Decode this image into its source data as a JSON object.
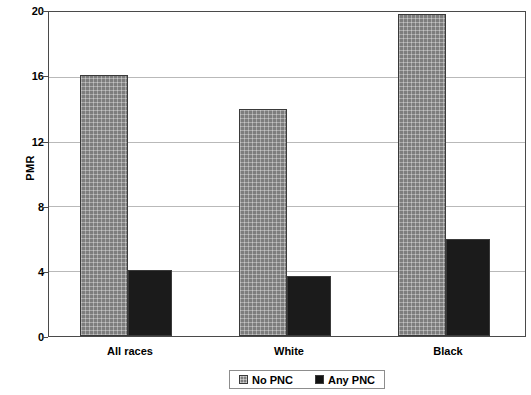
{
  "chart_data": {
    "type": "bar",
    "title": "",
    "xlabel": "",
    "ylabel": "PMR",
    "ylim": [
      0,
      20
    ],
    "yticks": [
      0,
      4,
      8,
      12,
      16,
      20
    ],
    "ytick_labels": [
      "0",
      "4",
      "8",
      "12",
      "16",
      "20"
    ],
    "grid": true,
    "legend_position": "bottom-center",
    "categories": [
      "All races",
      "White",
      "Black"
    ],
    "series": [
      {
        "name": "No PNC",
        "color": "#7d7d7d",
        "pattern": "crosshatch",
        "values": [
          16.1,
          14.0,
          19.9
        ]
      },
      {
        "name": "Any PNC",
        "color": "#1b1b1b",
        "pattern": "solid",
        "values": [
          4.1,
          3.7,
          6.0
        ]
      }
    ]
  },
  "axis": {
    "y_title": "PMR",
    "y_ticks": [
      {
        "label": "20",
        "value": 20
      },
      {
        "label": "16",
        "value": 16
      },
      {
        "label": "12",
        "value": 12
      },
      {
        "label": "8",
        "value": 8
      },
      {
        "label": "4",
        "value": 4
      },
      {
        "label": "0",
        "value": 0
      }
    ],
    "x_ticks": [
      {
        "label": "All races"
      },
      {
        "label": "White"
      },
      {
        "label": "Black"
      }
    ]
  },
  "legend": {
    "entries": [
      {
        "label": "No PNC",
        "swatch": "gray-crosshatch-swatch"
      },
      {
        "label": "Any PNC",
        "swatch": "black-solid-swatch"
      }
    ]
  }
}
